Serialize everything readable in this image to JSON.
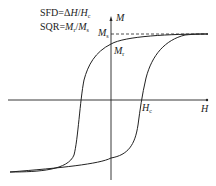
{
  "figure": {
    "formulas": {
      "sfd": {
        "prefix": "SFD=Δ",
        "var1": "H",
        "slash": "/",
        "var2": "H",
        "sub2": "c"
      },
      "sqr": {
        "prefix": "SQR=",
        "var1": "M",
        "sub1": "r",
        "slash": "/",
        "var2": "M",
        "sub2": "s"
      }
    },
    "axes": {
      "x_label": "H",
      "y_label": "M"
    },
    "markers": {
      "ms": {
        "var": "M",
        "sub": "s"
      },
      "mr": {
        "var": "M",
        "sub": "r"
      },
      "hc": {
        "var": "H",
        "sub": "c"
      }
    },
    "colors": {
      "line": "#222222",
      "background": "#ffffff"
    }
  }
}
